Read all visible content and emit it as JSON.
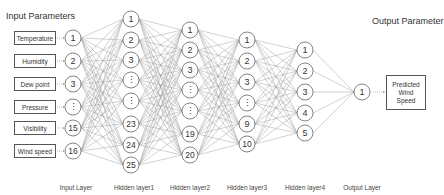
{
  "titles": {
    "input_parameters": "Input Parameters",
    "output_parameter": "Output Parameter"
  },
  "input_params": [
    {
      "label": "Temperature",
      "y": 38
    },
    {
      "label": "Humidity",
      "y": 61
    },
    {
      "label": "Dew point",
      "y": 84
    },
    {
      "label": "Pressure",
      "y": 107
    },
    {
      "label": "Visibility",
      "y": 128
    },
    {
      "label": "Wind speed",
      "y": 151
    }
  ],
  "output_param": {
    "label": "Predicted Wind Speed",
    "lines": [
      "Predicted",
      "Wind",
      "Speed"
    ]
  },
  "layers": [
    {
      "name": "Input Layer",
      "x": 73,
      "nodes": [
        {
          "label": "1",
          "y": 38
        },
        {
          "label": "2",
          "y": 61
        },
        {
          "label": "3",
          "y": 84
        },
        {
          "label": "⋮",
          "y": 107
        },
        {
          "label": "15",
          "y": 128
        },
        {
          "label": "16",
          "y": 151
        }
      ]
    },
    {
      "name": "Hidden layer1",
      "x": 131,
      "nodes": [
        {
          "label": "1",
          "y": 19
        },
        {
          "label": "2",
          "y": 40
        },
        {
          "label": "3",
          "y": 60
        },
        {
          "label": "⋮",
          "y": 80
        },
        {
          "label": "⋮",
          "y": 101
        },
        {
          "label": "23",
          "y": 124
        },
        {
          "label": "24",
          "y": 145
        },
        {
          "label": "25",
          "y": 165
        }
      ]
    },
    {
      "name": "Hidden layer2",
      "x": 190,
      "nodes": [
        {
          "label": "1",
          "y": 30
        },
        {
          "label": "2",
          "y": 50
        },
        {
          "label": "3",
          "y": 70
        },
        {
          "label": "⋮",
          "y": 90
        },
        {
          "label": "⋮",
          "y": 111
        },
        {
          "label": "19",
          "y": 134
        },
        {
          "label": "20",
          "y": 155
        }
      ]
    },
    {
      "name": "Hidden layer3",
      "x": 247,
      "nodes": [
        {
          "label": "1",
          "y": 40
        },
        {
          "label": "2",
          "y": 61
        },
        {
          "label": "3",
          "y": 82
        },
        {
          "label": "⋮",
          "y": 103
        },
        {
          "label": "9",
          "y": 124
        },
        {
          "label": "10",
          "y": 144
        }
      ]
    },
    {
      "name": "Hidden layer4",
      "x": 305,
      "nodes": [
        {
          "label": "1",
          "y": 50
        },
        {
          "label": "2",
          "y": 71
        },
        {
          "label": "3",
          "y": 92
        },
        {
          "label": "4",
          "y": 113
        },
        {
          "label": "5",
          "y": 133
        }
      ]
    },
    {
      "name": "Output Layer",
      "x": 362,
      "nodes": [
        {
          "label": "1",
          "y": 92
        }
      ]
    }
  ],
  "style": {
    "node_radius": 8,
    "line_color": "#9a9a9a",
    "node_stroke": "#666666",
    "text_color": "#333333",
    "label_y": 184
  }
}
